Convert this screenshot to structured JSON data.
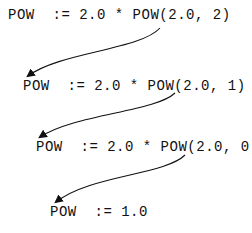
{
  "lines": [
    {
      "text": "POW  := 2.0 * POW(2.0, 2)"
    },
    {
      "text": "POW  := 2.0 * POW(2.0, 1)"
    },
    {
      "text": "POW  := 2.0 * POW(2.0, 0)"
    },
    {
      "text": "POW  := 1.0"
    }
  ],
  "colors": {
    "ink": "#111111",
    "background": "#ffffff"
  }
}
